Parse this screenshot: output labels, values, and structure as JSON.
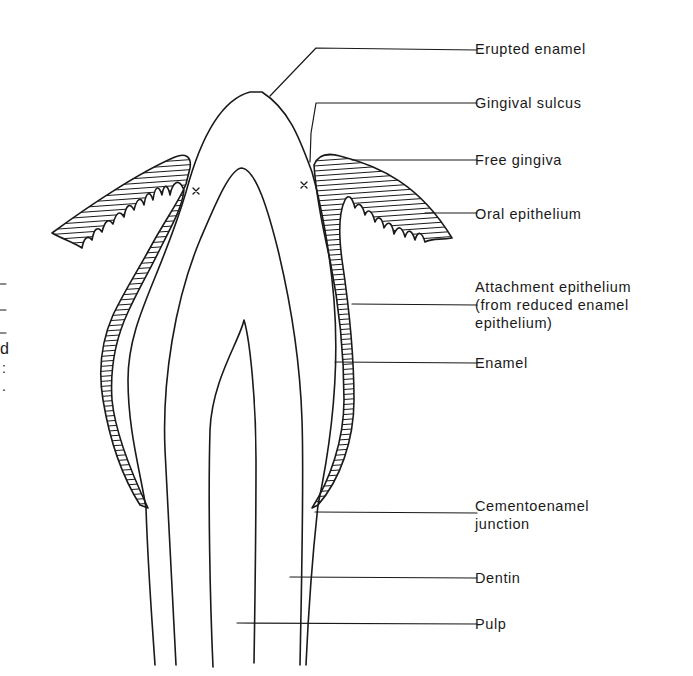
{
  "figure": {
    "labels": [
      {
        "id": "erupted-enamel",
        "text": "Erupted enamel"
      },
      {
        "id": "gingival-sulcus",
        "text": "Gingival sulcus"
      },
      {
        "id": "free-gingiva",
        "text": "Free gingiva"
      },
      {
        "id": "oral-epithelium",
        "text": "Oral epithelium"
      },
      {
        "id": "attachment-epithelium",
        "lines": [
          "Attachment epithelium",
          "(from reduced enamel",
          "epithelium)"
        ]
      },
      {
        "id": "enamel",
        "text": "Enamel"
      },
      {
        "id": "cementoenamel-junction",
        "lines": [
          "Cementoenamel",
          "junction"
        ]
      },
      {
        "id": "dentin",
        "text": "Dentin"
      },
      {
        "id": "pulp",
        "text": "Pulp"
      }
    ],
    "markers": {
      "left_x": "×",
      "right_x": "×"
    },
    "left_edge_fragment": {
      "letter": "d",
      "dots": ":",
      "dot": "."
    },
    "colors": {
      "ink": "#1a1a1a",
      "background": "#ffffff"
    }
  }
}
